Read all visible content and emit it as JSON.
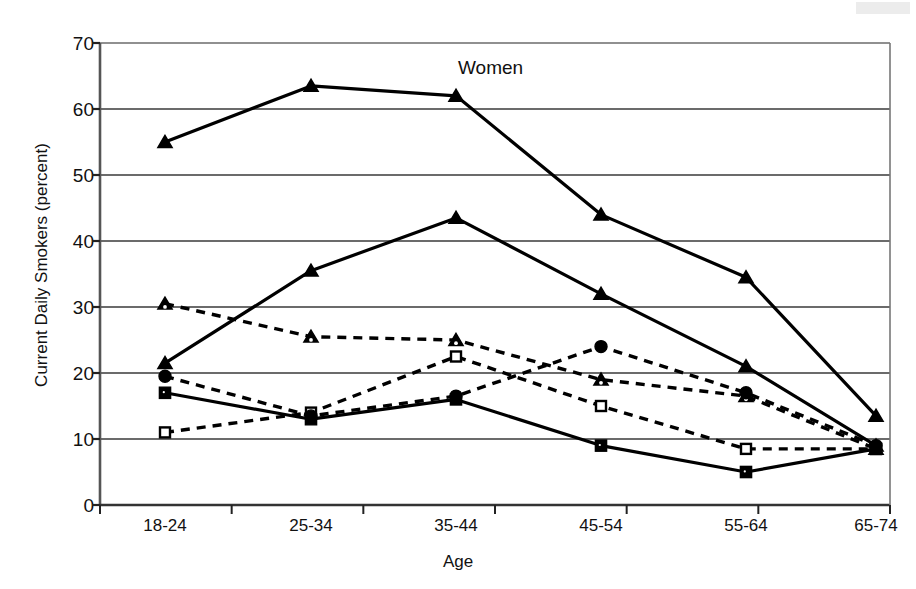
{
  "chart_data": {
    "type": "line",
    "title": "",
    "xlabel": "Age",
    "ylabel": "Current Daily Smokers (percent)",
    "ylim": [
      0,
      70
    ],
    "yticks": [
      0,
      10,
      20,
      30,
      40,
      50,
      60,
      70
    ],
    "grid": true,
    "legend": "none",
    "categories": [
      "18-24",
      "25-34",
      "35-44",
      "45-54",
      "55-64",
      "65-74"
    ],
    "annotations": [
      {
        "text": "Women",
        "x_category": "35-44",
        "y": 66
      }
    ],
    "series": [
      {
        "name": "series-1",
        "marker": "triangle-filled",
        "line": "solid",
        "color": "#000000",
        "values": [
          55,
          63.5,
          62,
          44,
          34.5,
          13.5
        ]
      },
      {
        "name": "series-2",
        "marker": "triangle-filled",
        "line": "solid",
        "color": "#000000",
        "values": [
          21.5,
          35.5,
          43.5,
          32,
          21,
          9
        ]
      },
      {
        "name": "series-3",
        "marker": "triangle-open",
        "line": "dashed",
        "color": "#000000",
        "values": [
          30.5,
          25.5,
          25,
          19,
          16.5,
          8.5
        ]
      },
      {
        "name": "series-4",
        "marker": "square-open",
        "line": "dashed",
        "color": "#000000",
        "values": [
          11,
          14,
          22.5,
          15,
          8.5,
          8.5
        ]
      },
      {
        "name": "series-5",
        "marker": "square-filled",
        "line": "solid",
        "color": "#000000",
        "values": [
          17,
          13,
          16,
          9,
          5,
          8.5
        ]
      },
      {
        "name": "series-6",
        "marker": "circle-filled",
        "line": "dashed",
        "color": "#000000",
        "values": [
          19.5,
          13.5,
          16.5,
          24,
          17,
          9
        ]
      }
    ]
  },
  "axes": {
    "y_tick_labels": [
      "70",
      "60",
      "50",
      "40",
      "30",
      "20",
      "10",
      "0"
    ],
    "x_tick_labels": [
      "18-24",
      "25-34",
      "35-44",
      "45-54",
      "55-64",
      "65-74"
    ],
    "y_axis_title": "Current Daily Smokers (percent)",
    "x_axis_title": "Age"
  },
  "annotation": {
    "women_label": "Women"
  },
  "style": {
    "ink": "#000000",
    "frame": "#6b6b6b",
    "grid": "#3a3a3a",
    "background": "#ffffff"
  }
}
